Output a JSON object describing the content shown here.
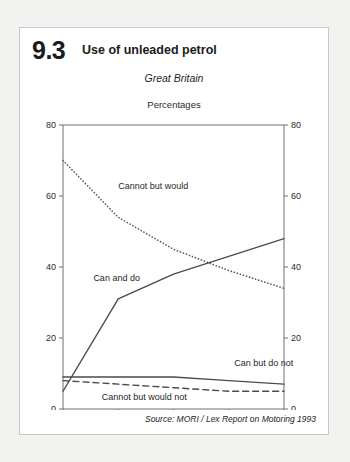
{
  "figure": {
    "number": "9.3",
    "title": "Use of unleaded petrol",
    "region": "Great Britain",
    "units": "Percentages",
    "source": "Source: MORI / Lex Report on Motoring 1993"
  },
  "chart_data": {
    "type": "line",
    "title": "Use of unleaded petrol",
    "subtitle": "Great Britain",
    "ylabel": "Percentages",
    "xlabel": "",
    "categories": [
      "1988",
      "1989",
      "1990",
      "1991",
      "1992"
    ],
    "x": [
      1988,
      1989,
      1990,
      1991,
      1992
    ],
    "ylim": [
      0,
      80
    ],
    "yticks": [
      0,
      20,
      40,
      60,
      80
    ],
    "grid": false,
    "legend": "inline-labels",
    "second_axis": true,
    "series": [
      {
        "name": "Cannot but would",
        "style": "dotted",
        "color": "#55565a",
        "values": [
          70,
          54,
          45,
          39,
          34
        ]
      },
      {
        "name": "Can and do",
        "style": "solid",
        "color": "#4a4b4f",
        "values": [
          5,
          31,
          38,
          43,
          48
        ]
      },
      {
        "name": "Can but do not",
        "style": "solid",
        "color": "#4a4b4f",
        "values": [
          9,
          9,
          9,
          8,
          7
        ]
      },
      {
        "name": "Cannot but would not",
        "style": "dashed",
        "color": "#4a4b4f",
        "values": [
          8,
          7,
          6,
          5,
          5
        ]
      }
    ],
    "annotations": [
      {
        "text": "Cannot but would",
        "x": 1989.0,
        "y": 62
      },
      {
        "text": "Can and do",
        "x": 1988.55,
        "y": 36
      },
      {
        "text": "Can but do not",
        "x": 1991.1,
        "y": 12
      },
      {
        "text": "Cannot but would not",
        "x": 1988.7,
        "y": 2.5
      }
    ],
    "axis_labels": {
      "left": [
        "0",
        "20",
        "40",
        "60",
        "80"
      ],
      "right": [
        "0",
        "20",
        "40",
        "60",
        "80"
      ],
      "bottom": [
        "1988",
        "1989",
        "1990",
        "1991",
        "1992"
      ]
    }
  }
}
